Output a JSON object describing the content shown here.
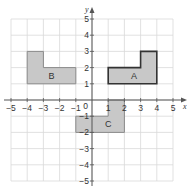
{
  "diagram": {
    "type": "coordinate-grid",
    "x_axis": {
      "label": "x",
      "min": -5,
      "max": 5,
      "ticks": [
        -5,
        -4,
        -3,
        -2,
        -1,
        1,
        2,
        3,
        4,
        5
      ]
    },
    "y_axis": {
      "label": "y",
      "min": -5,
      "max": 5,
      "ticks": [
        -5,
        -4,
        -3,
        -2,
        -1,
        1,
        2,
        3,
        4,
        5
      ]
    },
    "origin_label": "0",
    "colors": {
      "grid": "#d9d9d9",
      "axis": "#555555",
      "shape_fill": "#c8c8c8",
      "shape_stroke": "#8a8a8a",
      "shape_stroke_highlight": "#333333"
    },
    "shapes": [
      {
        "name": "A",
        "points": [
          [
            1,
            1
          ],
          [
            4,
            1
          ],
          [
            4,
            3
          ],
          [
            3,
            3
          ],
          [
            3,
            2
          ],
          [
            1,
            2
          ]
        ],
        "label_pos": [
          2.6,
          1.5
        ],
        "highlight": true
      },
      {
        "name": "B",
        "points": [
          [
            -4,
            1
          ],
          [
            -1,
            1
          ],
          [
            -1,
            2
          ],
          [
            -3,
            2
          ],
          [
            -3,
            3
          ],
          [
            -4,
            3
          ]
        ],
        "label_pos": [
          -2.5,
          1.5
        ],
        "highlight": false
      },
      {
        "name": "C",
        "points": [
          [
            -1,
            -2
          ],
          [
            2,
            -2
          ],
          [
            2,
            0
          ],
          [
            1,
            0
          ],
          [
            1,
            -1
          ],
          [
            -1,
            -1
          ]
        ],
        "label_pos": [
          1.0,
          -1.5
        ],
        "highlight": false
      }
    ]
  }
}
